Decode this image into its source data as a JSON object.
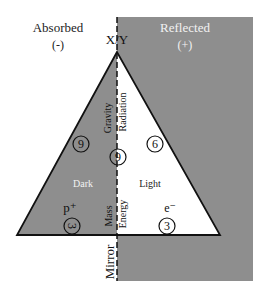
{
  "colors": {
    "gray": "#8e8e8e",
    "white": "#ffffff",
    "line": "#111111",
    "light_text": "#f2f2f2"
  },
  "regions": {
    "left_title": "Absorbed",
    "left_sign": "(-)",
    "right_title": "Reflected",
    "right_sign": "(+)",
    "apex_label": "X̸Y",
    "mirror_label": "Mirror"
  },
  "triangle": {
    "upper_left_label": "Gravity",
    "upper_right_label": "Radiation",
    "lower_left_label": "Mass",
    "lower_right_label": "Energy",
    "left_region_label": "Dark",
    "right_region_label": "Light",
    "left_particle": "p⁺",
    "right_particle": "e⁻"
  },
  "circled_numbers": {
    "left_upper": "6",
    "center": "9",
    "right_upper": "6",
    "left_lower": "3",
    "right_lower": "3"
  }
}
